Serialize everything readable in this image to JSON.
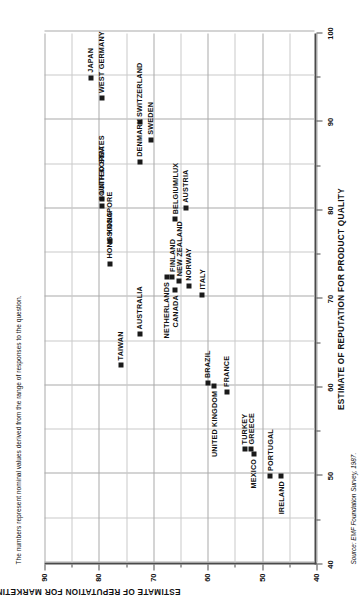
{
  "figure": {
    "note": "The numbers represent nominal values derived from the range of responses to the question.",
    "source": "Source: EMF Foundation Survey, 1987."
  },
  "chart_data": {
    "type": "scatter",
    "title": "",
    "xlabel": "ESTIMATE OF REPUTATION FOR PRODUCT QUALITY",
    "ylabel": "ESTIMATE OF REPUTATION FOR MARKETING PUSH",
    "xlim": [
      40,
      100
    ],
    "ylim": [
      40,
      90
    ],
    "xticks": [
      40,
      50,
      60,
      70,
      80,
      90,
      100
    ],
    "xticklabels": [
      "40",
      "50",
      "60",
      "70",
      "80",
      "90",
      "100"
    ],
    "yticks": [
      40,
      50,
      60,
      70,
      80,
      90
    ],
    "yticklabels": [
      "40",
      "50",
      "60",
      "70",
      "80",
      "90"
    ],
    "x_minor_step": 5,
    "y_minor_step": 5,
    "grid": true,
    "legend": false,
    "points": [
      {
        "label": "JAPAN",
        "x": 95.0,
        "y": 81.5,
        "label_pos": "left"
      },
      {
        "label": "WEST GERMANY",
        "x": 92.7,
        "y": 79.5,
        "label_pos": "left"
      },
      {
        "label": "SWITZERLAND",
        "x": 90.0,
        "y": 72.5,
        "label_pos": "left"
      },
      {
        "label": "SWEDEN",
        "x": 88.0,
        "y": 70.5,
        "label_pos": "left"
      },
      {
        "label": "DENMARK",
        "x": 85.5,
        "y": 72.5,
        "label_pos": "left"
      },
      {
        "label": "AUSTRIA",
        "x": 80.3,
        "y": 64.0,
        "label_pos": "left"
      },
      {
        "label": "BELGIUM/LUX",
        "x": 79.0,
        "y": 66.0,
        "label_pos": "left"
      },
      {
        "label": "UNITED STATES",
        "x": 81.3,
        "y": 79.5,
        "label_pos": "left"
      },
      {
        "label": "SOUTH KOREA",
        "x": 80.5,
        "y": 79.5,
        "label_pos": "left"
      },
      {
        "label": "SINGAPORE",
        "x": 76.5,
        "y": 78.0,
        "label_pos": "left"
      },
      {
        "label": "HONG KONG",
        "x": 74.0,
        "y": 78.0,
        "label_pos": "left"
      },
      {
        "label": "FINLAND",
        "x": 72.5,
        "y": 66.5,
        "label_pos": "left"
      },
      {
        "label": "NEW ZEALAND",
        "x": 72.0,
        "y": 65.2,
        "label_pos": "left"
      },
      {
        "label": "NETHERLANDS",
        "x": 72.5,
        "y": 67.5,
        "label_pos": "right"
      },
      {
        "label": "CANADA",
        "x": 71.0,
        "y": 66.0,
        "label_pos": "right"
      },
      {
        "label": "NORWAY",
        "x": 71.5,
        "y": 63.5,
        "label_pos": "left"
      },
      {
        "label": "ITALY",
        "x": 70.5,
        "y": 61.0,
        "label_pos": "left"
      },
      {
        "label": "AUSTRALIA",
        "x": 66.0,
        "y": 72.5,
        "label_pos": "left"
      },
      {
        "label": "TAIWAN",
        "x": 62.5,
        "y": 76.0,
        "label_pos": "left"
      },
      {
        "label": "BRAZIL",
        "x": 60.5,
        "y": 60.0,
        "label_pos": "left"
      },
      {
        "label": "UNITED KINGDOM",
        "x": 60.2,
        "y": 58.8,
        "label_pos": "right"
      },
      {
        "label": "FRANCE",
        "x": 59.5,
        "y": 56.5,
        "label_pos": "left"
      },
      {
        "label": "MEXICO",
        "x": 52.5,
        "y": 51.5,
        "label_pos": "right"
      },
      {
        "label": "TURKEY",
        "x": 53.0,
        "y": 53.2,
        "label_pos": "left"
      },
      {
        "label": "GREECE",
        "x": 53.0,
        "y": 52.0,
        "label_pos": "left"
      },
      {
        "label": "PORTUGAL",
        "x": 50.0,
        "y": 48.5,
        "label_pos": "left"
      },
      {
        "label": "IRELAND",
        "x": 50.0,
        "y": 46.5,
        "label_pos": "right"
      }
    ]
  }
}
